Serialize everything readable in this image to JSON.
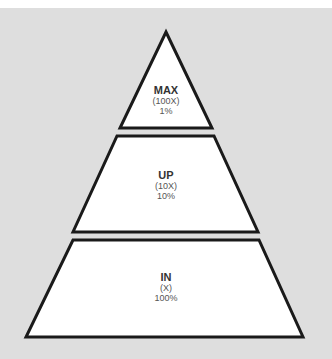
{
  "colors": {
    "background": "#dedede",
    "fill": "#ffffff",
    "stroke": "#1a1a1a",
    "text_bold": "#333333",
    "text": "#555555"
  },
  "pyramid": {
    "levels": [
      {
        "title": "MAX",
        "multiplier": "(100X)",
        "percent": "1%"
      },
      {
        "title": "UP",
        "multiplier": "(10X)",
        "percent": "10%"
      },
      {
        "title": "IN",
        "multiplier": "(X)",
        "percent": "100%"
      }
    ]
  }
}
